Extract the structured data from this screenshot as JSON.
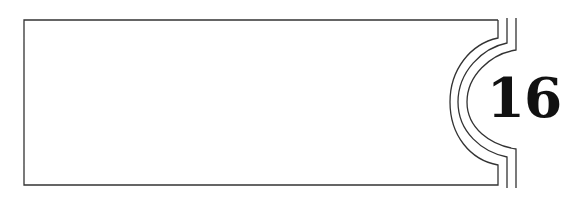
{
  "banner": {
    "chapter_number": "16",
    "colors": {
      "stroke": "#333333",
      "text": "#111111",
      "background": "#ffffff"
    }
  }
}
